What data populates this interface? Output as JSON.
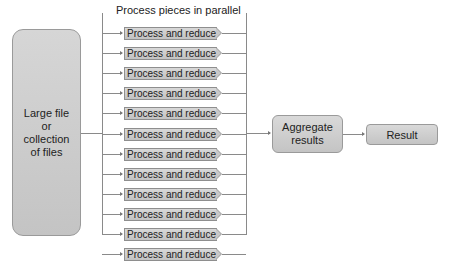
{
  "diagram": {
    "title": "Process pieces in parallel",
    "source": {
      "lines": [
        "Large file",
        "or",
        "collection",
        "of files"
      ]
    },
    "process_steps": [
      {
        "label": "Process and reduce"
      },
      {
        "label": "Process and reduce"
      },
      {
        "label": "Process and reduce"
      },
      {
        "label": "Process and reduce"
      },
      {
        "label": "Process and reduce"
      },
      {
        "label": "Process and reduce"
      },
      {
        "label": "Process and reduce"
      },
      {
        "label": "Process and reduce"
      },
      {
        "label": "Process and reduce"
      },
      {
        "label": "Process and reduce"
      },
      {
        "label": "Process and reduce"
      },
      {
        "label": "Process and reduce"
      }
    ],
    "aggregate": {
      "lines": [
        "Aggregate",
        "results"
      ]
    },
    "result": {
      "label": "Result"
    }
  }
}
